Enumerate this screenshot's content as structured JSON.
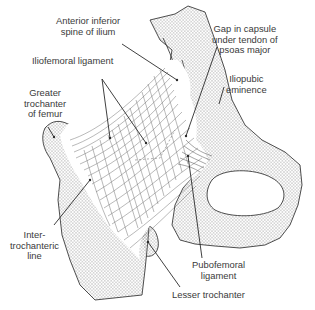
{
  "figure": {
    "colors": {
      "background": "#ffffff",
      "line": "#3a3a3a",
      "bone_stipple": "#8a8a8a",
      "text": "#3a3a3a"
    }
  },
  "labels": {
    "anterior_inferior_spine": [
      "Anterior inferior",
      "spine of ilium"
    ],
    "iliofemoral_ligament": [
      "Iliofemoral ligament"
    ],
    "greater_trochanter": [
      "Greater",
      "trochanter",
      "of femur"
    ],
    "gap_in_capsule": [
      "Gap in capsule",
      "under tendon of",
      "psoas major"
    ],
    "iliopubic_eminence": [
      "Iliopubic",
      "eminence"
    ],
    "intertrochanteric_line": [
      "Inter-",
      "trochanteric",
      "line"
    ],
    "pubofemoral_ligament": [
      "Pubofemoral",
      "ligament"
    ],
    "lesser_trochanter": [
      "Lesser trochanter"
    ]
  }
}
